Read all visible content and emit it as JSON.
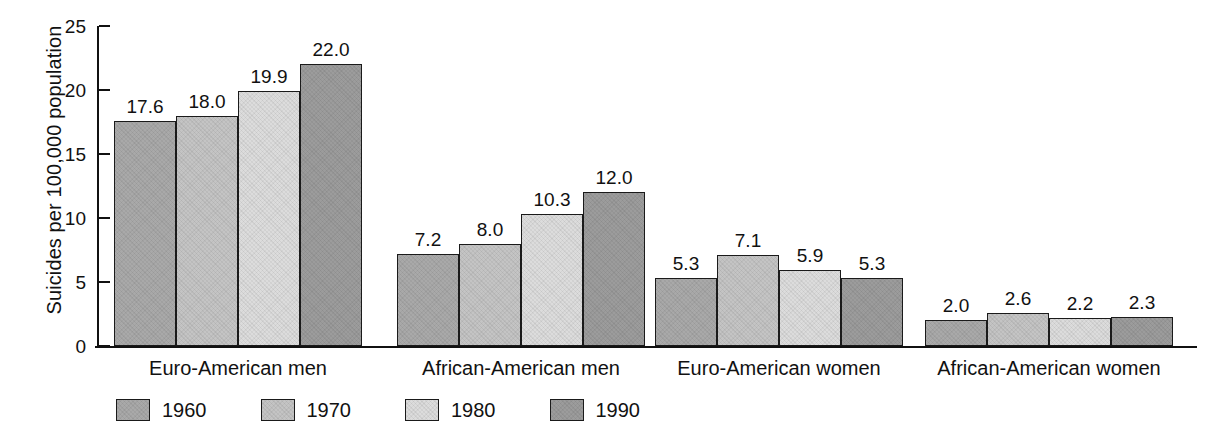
{
  "chart_data": {
    "type": "bar",
    "title": "",
    "xlabel": "",
    "ylabel": "Suicides per 100,000 population",
    "ylim": [
      0,
      25
    ],
    "yticks": [
      0,
      5,
      10,
      15,
      20,
      25
    ],
    "ytick_labels": [
      "0",
      "5",
      "10",
      "15",
      "20",
      "25"
    ],
    "grid": false,
    "legend_position": "bottom-left",
    "categories": [
      "Euro-American men",
      "African-American men",
      "Euro-American women",
      "African-American women"
    ],
    "series": [
      {
        "name": "1960",
        "color": "#a9a9a9",
        "values": [
          17.6,
          7.2,
          5.3,
          2.0
        ],
        "labels": [
          "17.6",
          "7.2",
          "5.3",
          "2.0"
        ]
      },
      {
        "name": "1970",
        "color": "#c4c4c4",
        "values": [
          18.0,
          8.0,
          7.1,
          2.6
        ],
        "labels": [
          "18.0",
          "8.0",
          "7.1",
          "2.6"
        ]
      },
      {
        "name": "1980",
        "color": "#dcdcdc",
        "values": [
          19.9,
          10.3,
          5.9,
          2.2
        ],
        "labels": [
          "19.9",
          "10.3",
          "5.9",
          "2.2"
        ]
      },
      {
        "name": "1990",
        "color": "#9c9c9c",
        "values": [
          22.0,
          12.0,
          5.3,
          2.3
        ],
        "labels": [
          "22.0",
          "12.0",
          "5.3",
          "2.3"
        ]
      }
    ]
  },
  "axis": {
    "y_label": "Suicides per 100,000 population",
    "y_ticks": [
      "25",
      "20",
      "15",
      "10",
      "5",
      "0"
    ]
  },
  "legend": {
    "items": [
      {
        "label": "1960"
      },
      {
        "label": "1970"
      },
      {
        "label": "1980"
      },
      {
        "label": "1990"
      }
    ]
  }
}
